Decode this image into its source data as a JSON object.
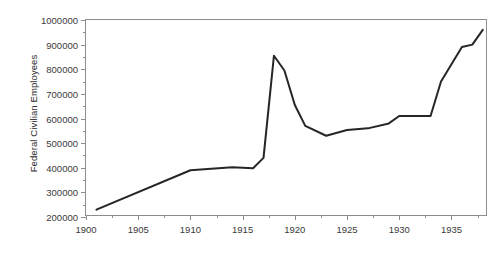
{
  "chart_data": {
    "type": "line",
    "title": "",
    "xlabel": "",
    "ylabel": "Federal Civilian Employees",
    "xlim": [
      1900,
      1938.5
    ],
    "ylim": [
      200000,
      1000000
    ],
    "grid": false,
    "legend": "none",
    "line_color": "#262626",
    "axis_color": "#8d8d8d",
    "text_color": "#3a3a3a",
    "background": "#ffffff",
    "y_ticks": [
      200000,
      300000,
      400000,
      500000,
      600000,
      700000,
      800000,
      900000,
      1000000
    ],
    "y_tick_labels": [
      "200000",
      "300000",
      "400000",
      "500000",
      "600000",
      "700000",
      "800000",
      "900000",
      "1000000"
    ],
    "y_minor_ticks": [
      250000,
      350000,
      450000,
      550000,
      650000,
      750000,
      850000,
      950000
    ],
    "x_ticks": [
      1900,
      1905,
      1910,
      1915,
      1920,
      1925,
      1930,
      1935
    ],
    "x_tick_labels": [
      "1900",
      "1905",
      "1910",
      "1915",
      "1920",
      "1925",
      "1930",
      "1935"
    ],
    "x_minor_ticks": [
      1902.5,
      1907.5,
      1912.5,
      1917.5,
      1922.5,
      1927.5,
      1932.5,
      1937.5
    ],
    "x": [
      1901,
      1910,
      1914,
      1916,
      1917,
      1918,
      1919,
      1920,
      1921,
      1923,
      1925,
      1927,
      1929,
      1930,
      1933,
      1934,
      1936,
      1937,
      1938
    ],
    "values": [
      230000,
      390000,
      402000,
      398000,
      440000,
      855000,
      795000,
      655000,
      570000,
      530000,
      553000,
      560000,
      580000,
      610000,
      610000,
      750000,
      890000,
      900000,
      960000
    ],
    "series": [
      {
        "name": "Federal Civilian Employees",
        "values": [
          230000,
          390000,
          402000,
          398000,
          440000,
          855000,
          795000,
          655000,
          570000,
          530000,
          553000,
          560000,
          580000,
          610000,
          610000,
          750000,
          890000,
          900000,
          960000
        ]
      }
    ]
  }
}
